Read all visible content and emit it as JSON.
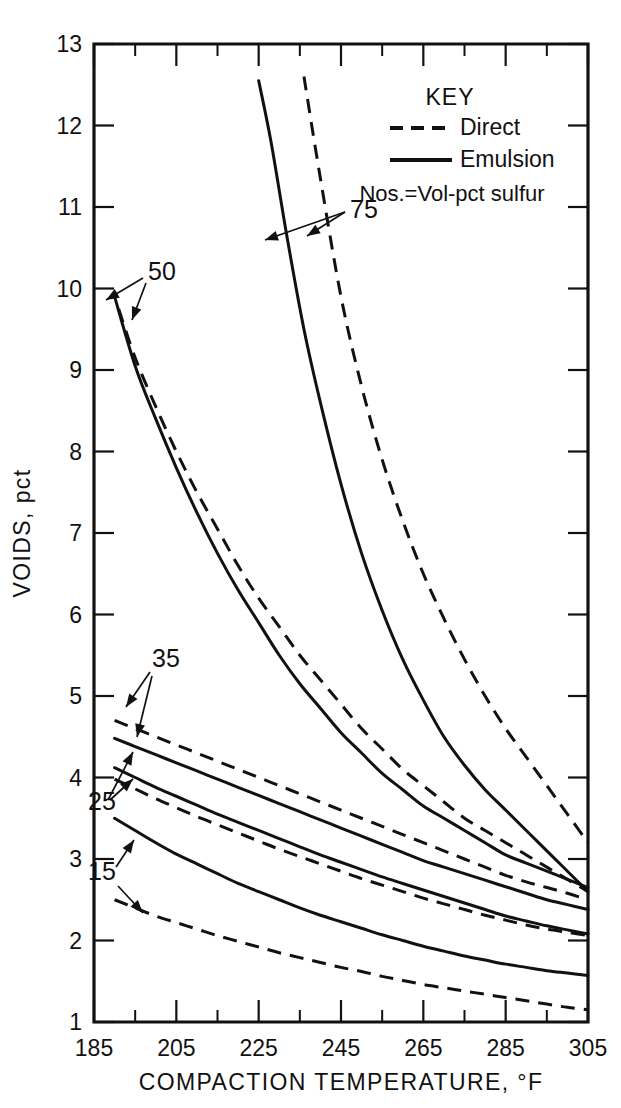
{
  "figure": {
    "background_color": "#ffffff",
    "ink_color": "#111111"
  },
  "chart_data": {
    "type": "line",
    "title": "",
    "xlabel": "COMPACTION TEMPERATURE, °F",
    "ylabel": "VOIDS, pct",
    "xlim": [
      185,
      305
    ],
    "ylim": [
      1,
      13
    ],
    "xticks": [
      185,
      205,
      225,
      245,
      265,
      285,
      305
    ],
    "xtick_labels": [
      "185",
      "205",
      "225",
      "245",
      "265",
      "285",
      "305"
    ],
    "xminor_step": 10,
    "yticks": [
      1,
      2,
      3,
      4,
      5,
      6,
      7,
      8,
      9,
      10,
      11,
      12,
      13
    ],
    "ytick_labels": [
      "1",
      "2",
      "3",
      "4",
      "5",
      "6",
      "7",
      "8",
      "9",
      "10",
      "11",
      "12",
      "13"
    ],
    "grid": false,
    "legend_position": "upper-right-inside",
    "legend": {
      "title": "KEY",
      "entries": [
        {
          "label": "Direct",
          "style": "dashed"
        },
        {
          "label": "Emulsion",
          "style": "solid"
        }
      ],
      "note": "Nos.=Vol-pct sulfur"
    },
    "annotations": [
      {
        "text": "75",
        "points_to": [
          "75-emulsion",
          "75-direct"
        ]
      },
      {
        "text": "50",
        "points_to": [
          "50-emulsion",
          "50-direct"
        ]
      },
      {
        "text": "35",
        "points_to": [
          "35-emulsion",
          "35-direct"
        ]
      },
      {
        "text": "25",
        "points_to": [
          "25-emulsion",
          "25-direct"
        ]
      },
      {
        "text": "15",
        "points_to": [
          "15-emulsion",
          "15-direct"
        ]
      }
    ],
    "series": [
      {
        "name": "75-emulsion",
        "label": "75",
        "style": "solid",
        "x": [
          225,
          228,
          232,
          236,
          240,
          245,
          250,
          255,
          260,
          265,
          270,
          275,
          280,
          285,
          290,
          295,
          300,
          305
        ],
        "values": [
          12.55,
          11.8,
          10.6,
          9.5,
          8.6,
          7.6,
          6.75,
          6.05,
          5.45,
          4.95,
          4.5,
          4.15,
          3.85,
          3.6,
          3.35,
          3.1,
          2.85,
          2.6
        ]
      },
      {
        "name": "75-direct",
        "label": "75",
        "style": "dashed",
        "x": [
          236,
          240,
          245,
          250,
          255,
          260,
          265,
          270,
          275,
          280,
          285,
          290,
          295,
          300,
          305
        ],
        "values": [
          12.6,
          11.35,
          9.9,
          8.8,
          7.9,
          7.15,
          6.5,
          5.95,
          5.45,
          5.0,
          4.6,
          4.25,
          3.9,
          3.55,
          3.2
        ]
      },
      {
        "name": "50-emulsion",
        "label": "50",
        "style": "solid",
        "x": [
          190,
          195,
          200,
          205,
          210,
          215,
          220,
          225,
          230,
          235,
          240,
          245,
          250,
          255,
          260,
          265,
          270,
          275,
          280,
          285,
          290,
          295,
          300,
          305
        ],
        "values": [
          9.9,
          9.05,
          8.4,
          7.8,
          7.25,
          6.75,
          6.3,
          5.9,
          5.5,
          5.15,
          4.85,
          4.55,
          4.3,
          4.05,
          3.85,
          3.65,
          3.5,
          3.35,
          3.2,
          3.05,
          2.95,
          2.85,
          2.75,
          2.65
        ]
      },
      {
        "name": "50-direct",
        "label": "50",
        "style": "dashed",
        "x": [
          191,
          195,
          200,
          205,
          210,
          215,
          220,
          225,
          230,
          235,
          240,
          245,
          250,
          255,
          260,
          265,
          270,
          275,
          280,
          285,
          290,
          295,
          300,
          305
        ],
        "values": [
          9.75,
          9.15,
          8.55,
          8.0,
          7.5,
          7.05,
          6.6,
          6.2,
          5.85,
          5.5,
          5.2,
          4.9,
          4.6,
          4.35,
          4.1,
          3.9,
          3.7,
          3.5,
          3.35,
          3.2,
          3.05,
          2.9,
          2.75,
          2.6
        ]
      },
      {
        "name": "35-direct",
        "label": "35",
        "style": "dashed",
        "x": [
          190,
          195,
          200,
          205,
          210,
          215,
          220,
          225,
          230,
          235,
          240,
          245,
          250,
          255,
          260,
          265,
          270,
          275,
          280,
          285,
          290,
          295,
          300,
          305
        ],
        "values": [
          4.7,
          4.6,
          4.5,
          4.4,
          4.3,
          4.2,
          4.1,
          4.0,
          3.9,
          3.8,
          3.7,
          3.6,
          3.5,
          3.4,
          3.3,
          3.2,
          3.1,
          3.0,
          2.9,
          2.8,
          2.72,
          2.65,
          2.58,
          2.5
        ]
      },
      {
        "name": "35-emulsion",
        "label": "35",
        "style": "solid",
        "x": [
          190,
          195,
          200,
          205,
          210,
          215,
          220,
          225,
          230,
          235,
          240,
          245,
          250,
          255,
          260,
          265,
          270,
          275,
          280,
          285,
          290,
          295,
          300,
          305
        ],
        "values": [
          4.48,
          4.38,
          4.28,
          4.18,
          4.08,
          3.98,
          3.88,
          3.78,
          3.68,
          3.58,
          3.48,
          3.38,
          3.28,
          3.18,
          3.08,
          2.98,
          2.9,
          2.82,
          2.74,
          2.66,
          2.58,
          2.5,
          2.44,
          2.38
        ]
      },
      {
        "name": "25-emulsion",
        "label": "25",
        "style": "solid",
        "x": [
          190,
          195,
          200,
          205,
          210,
          215,
          220,
          225,
          230,
          235,
          240,
          245,
          250,
          255,
          260,
          265,
          270,
          275,
          280,
          285,
          290,
          295,
          300,
          305
        ],
        "values": [
          4.12,
          4.0,
          3.88,
          3.77,
          3.66,
          3.55,
          3.45,
          3.35,
          3.25,
          3.15,
          3.05,
          2.96,
          2.87,
          2.78,
          2.7,
          2.62,
          2.54,
          2.46,
          2.38,
          2.3,
          2.24,
          2.18,
          2.13,
          2.08
        ]
      },
      {
        "name": "25-direct",
        "label": "25",
        "style": "dashed",
        "x": [
          190,
          195,
          200,
          205,
          210,
          215,
          220,
          225,
          230,
          235,
          240,
          245,
          250,
          255,
          260,
          265,
          270,
          275,
          280,
          285,
          290,
          295,
          300,
          305
        ],
        "values": [
          3.98,
          3.86,
          3.74,
          3.63,
          3.52,
          3.42,
          3.32,
          3.22,
          3.12,
          3.03,
          2.94,
          2.85,
          2.76,
          2.68,
          2.6,
          2.52,
          2.45,
          2.38,
          2.31,
          2.25,
          2.19,
          2.14,
          2.1,
          2.06
        ]
      },
      {
        "name": "15-emulsion",
        "label": "15",
        "style": "solid",
        "x": [
          190,
          195,
          200,
          205,
          210,
          215,
          220,
          225,
          230,
          235,
          240,
          245,
          250,
          255,
          260,
          265,
          270,
          275,
          280,
          285,
          290,
          295,
          300,
          305
        ],
        "values": [
          3.5,
          3.35,
          3.2,
          3.06,
          2.94,
          2.82,
          2.7,
          2.6,
          2.5,
          2.4,
          2.31,
          2.23,
          2.15,
          2.07,
          2.0,
          1.93,
          1.87,
          1.81,
          1.76,
          1.71,
          1.67,
          1.63,
          1.6,
          1.57
        ]
      },
      {
        "name": "15-direct",
        "label": "15",
        "style": "dashed",
        "x": [
          190,
          195,
          200,
          205,
          210,
          215,
          220,
          225,
          230,
          235,
          240,
          245,
          250,
          255,
          260,
          265,
          270,
          275,
          280,
          285,
          290,
          295,
          300,
          305
        ],
        "values": [
          2.5,
          2.4,
          2.3,
          2.22,
          2.14,
          2.06,
          1.99,
          1.92,
          1.85,
          1.79,
          1.73,
          1.67,
          1.62,
          1.56,
          1.51,
          1.46,
          1.42,
          1.38,
          1.34,
          1.3,
          1.26,
          1.22,
          1.18,
          1.15
        ]
      }
    ]
  }
}
